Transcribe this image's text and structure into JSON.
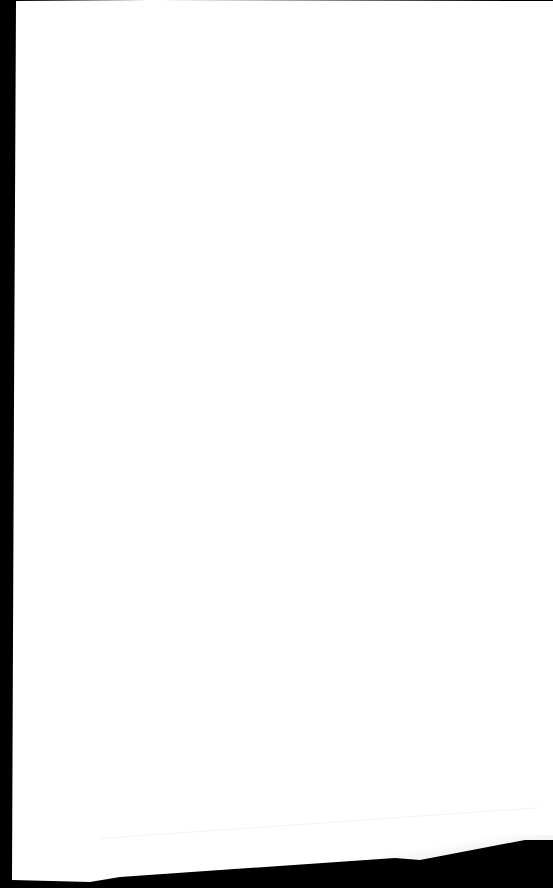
{
  "document": {
    "type": "blank-paper-sheet",
    "visible_text": [],
    "colors": {
      "background": "#000000",
      "paper": "#ffffff"
    }
  }
}
